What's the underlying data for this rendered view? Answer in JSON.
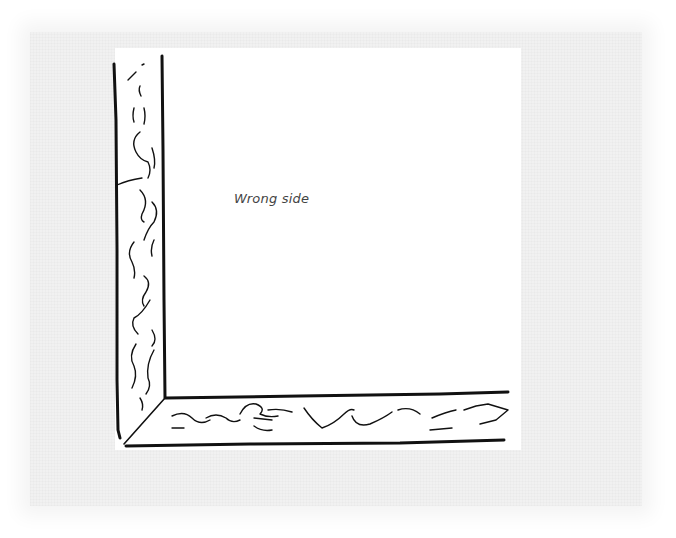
{
  "diagram": {
    "label": "Wrong side",
    "colors": {
      "background_texture": "#f1f1f1",
      "fabric": "#ffffff",
      "ink": "#111111",
      "label": "#444444"
    }
  }
}
